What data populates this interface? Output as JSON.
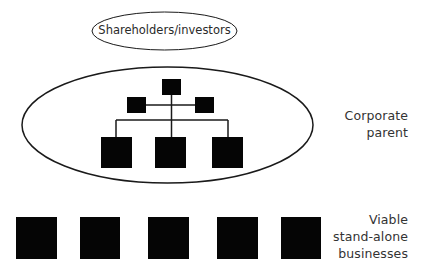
{
  "title_node": {
    "label": "Shareholders/investors",
    "ellipse": {
      "cx": 164.5,
      "cy": 31,
      "rx": 72.5,
      "ry": 19
    }
  },
  "corporate_parent": {
    "label_line1": "Corporate",
    "label_line2": "parent",
    "ellipse": {
      "cx": 167.5,
      "cy": 125,
      "rx": 145.5,
      "ry": 58
    },
    "org_chart": {
      "top_box": {
        "x": 162,
        "y": 79,
        "w": 19,
        "h": 16
      },
      "side_boxes": [
        {
          "x": 127,
          "y": 97,
          "w": 19,
          "h": 16
        },
        {
          "x": 195,
          "y": 97,
          "w": 19,
          "h": 16
        }
      ],
      "bottom_boxes": [
        {
          "x": 101,
          "y": 137,
          "w": 31,
          "h": 31
        },
        {
          "x": 155,
          "y": 137,
          "w": 31,
          "h": 31
        },
        {
          "x": 212,
          "y": 137,
          "w": 31,
          "h": 31
        }
      ]
    }
  },
  "businesses": {
    "label_line1": "Viable",
    "label_line2": "stand-alone",
    "label_line3": "businesses",
    "boxes": [
      {
        "x": 16,
        "y": 217,
        "w": 41,
        "h": 42
      },
      {
        "x": 80,
        "y": 217,
        "w": 40,
        "h": 42
      },
      {
        "x": 148,
        "y": 217,
        "w": 41,
        "h": 42
      },
      {
        "x": 217,
        "y": 217,
        "w": 41,
        "h": 42
      },
      {
        "x": 281,
        "y": 217,
        "w": 40,
        "h": 42
      }
    ]
  },
  "colors": {
    "stroke": "#1a1a1a",
    "fill": "#050505",
    "background": "#ffffff"
  }
}
